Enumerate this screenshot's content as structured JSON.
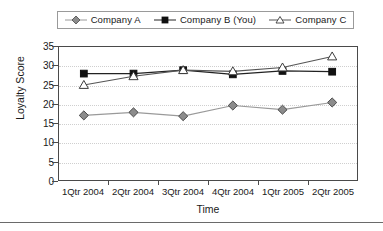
{
  "chart_data": {
    "type": "line",
    "title": "",
    "xlabel": "Time",
    "ylabel": "Loyalty Score",
    "categories": [
      "1Qtr 2004",
      "2Qtr 2004",
      "3Qtr 2004",
      "4Qtr 2004",
      "1Qtr 2005",
      "2Qtr 2005"
    ],
    "ylim": [
      0,
      35
    ],
    "yticks": [
      0,
      5,
      10,
      15,
      20,
      25,
      30,
      35
    ],
    "ytick_labels": [
      "0",
      "5",
      "10",
      "15",
      "20",
      "25",
      "30",
      "35"
    ],
    "grid": true,
    "legend_position": "top",
    "series": [
      {
        "name": "Company A",
        "values": [
          17.0,
          17.8,
          16.8,
          19.6,
          18.5,
          20.4
        ],
        "marker": "diamond",
        "marker_fill": "#8c8c8c",
        "marker_stroke": "#4a4a4a",
        "line_color": "#9a9a9a"
      },
      {
        "name": "Company B (You)",
        "values": [
          28.0,
          28.0,
          28.9,
          27.8,
          28.7,
          28.5
        ],
        "marker": "square",
        "marker_fill": "#111111",
        "marker_stroke": "#111111",
        "line_color": "#222222"
      },
      {
        "name": "Company C",
        "values": [
          25.0,
          27.3,
          28.9,
          28.6,
          29.6,
          32.5
        ],
        "marker": "triangle",
        "marker_fill": "#ffffff",
        "marker_stroke": "#3a3a3a",
        "line_color": "#555555"
      }
    ]
  },
  "legend": {
    "entries": [
      {
        "label": "Company A"
      },
      {
        "label": "Company B (You)"
      },
      {
        "label": "Company C"
      }
    ]
  },
  "colors": {
    "company_a": "#8c8c8c",
    "company_b": "#111111",
    "company_c": "#ffffff",
    "axis": "#4a4a4a",
    "grid": "#cfcfcf"
  }
}
